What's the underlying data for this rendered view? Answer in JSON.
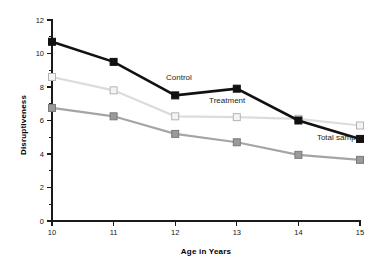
{
  "chart_data": {
    "type": "line",
    "title": "",
    "xlabel": "Age in Years",
    "ylabel": "Disruptiveness",
    "x": [
      10,
      11,
      12,
      13,
      14,
      15
    ],
    "categories": [
      "10",
      "11",
      "12",
      "13",
      "14",
      "15"
    ],
    "xlim": [
      10,
      15
    ],
    "ylim": [
      0,
      12
    ],
    "grid": false,
    "legend_position": "inline-annotations",
    "y_ticks_major": [
      0,
      2,
      4,
      6,
      8,
      10,
      12
    ],
    "y_tick_labels": [
      "0",
      "2",
      "4",
      "6",
      "8",
      "10",
      "12"
    ],
    "y_ticks_minor": [
      1,
      3,
      5,
      7,
      9,
      11
    ],
    "x_ticks": [
      10,
      11,
      12,
      13,
      14,
      15
    ],
    "x_tick_labels": [
      "10",
      "11",
      "12",
      "13",
      "14",
      "15"
    ],
    "series": [
      {
        "name": "Control",
        "values": [
          10.7,
          9.5,
          7.5,
          7.9,
          6.0,
          4.9
        ],
        "line_color": "#111111",
        "marker_fill": "#111111",
        "marker_edge": "#111111",
        "marker": "square",
        "line_width": 2.6,
        "annotation": "Control"
      },
      {
        "name": "Treatment",
        "values": [
          8.6,
          7.8,
          6.25,
          6.2,
          6.1,
          5.7
        ],
        "line_color": "#dcdcdc",
        "marker_fill": "#f4f4f4",
        "marker_edge": "#b4b4b4",
        "marker": "square",
        "line_width": 2.2,
        "annotation": "Treatment"
      },
      {
        "name": "Total sample",
        "values": [
          6.75,
          6.25,
          5.2,
          4.7,
          3.95,
          3.65
        ],
        "line_color": "#a5a5a5",
        "marker_fill": "#9a9a9a",
        "marker_edge": "#7a7a7a",
        "marker": "square",
        "line_width": 2.2,
        "annotation": "Total sample"
      }
    ],
    "annotations": [
      {
        "text": "Control",
        "x": 11.85,
        "y": 8.45
      },
      {
        "text": "Treatment",
        "x": 12.55,
        "y": 7.05
      },
      {
        "text": "Total sample",
        "x": 14.3,
        "y": 4.85
      }
    ]
  }
}
